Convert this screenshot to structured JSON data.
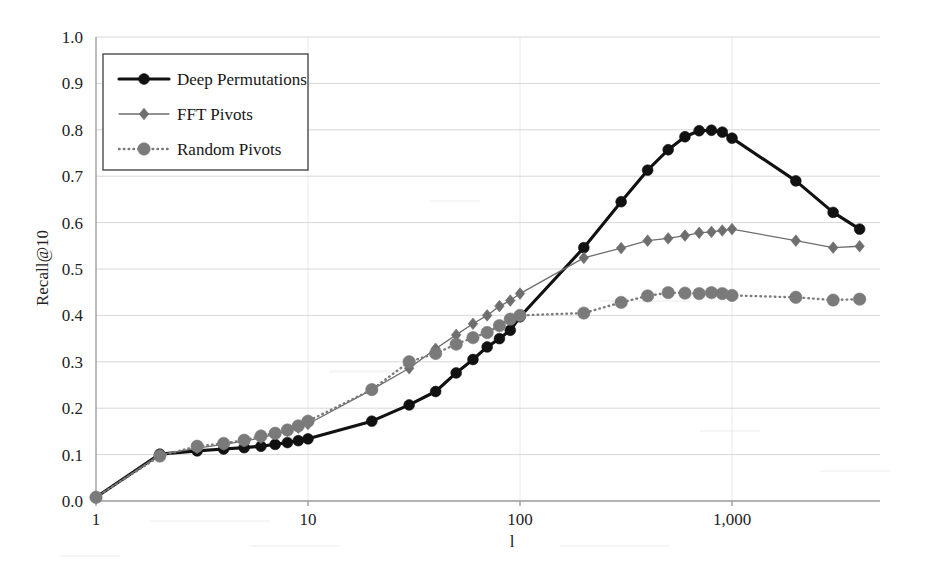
{
  "chart_data": {
    "type": "line",
    "title": "",
    "subtitle": "",
    "xlabel": "l",
    "ylabel": "Recall@10",
    "xscale": "log",
    "xlim": [
      1,
      4096
    ],
    "ylim": [
      0.0,
      1.0
    ],
    "grid": true,
    "legend_position": "top-left",
    "x_tick_labels": [
      "1",
      "10",
      "100",
      "1,000"
    ],
    "x_tick_values": [
      1,
      10,
      100,
      1000
    ],
    "y_tick_labels": [
      "0.0",
      "0.1",
      "0.2",
      "0.3",
      "0.4",
      "0.5",
      "0.6",
      "0.7",
      "0.8",
      "0.9",
      "1.0"
    ],
    "y_tick_values": [
      0.0,
      0.1,
      0.2,
      0.3,
      0.4,
      0.5,
      0.6,
      0.7,
      0.8,
      0.9,
      1.0
    ],
    "series": [
      {
        "name": "Deep Permutations",
        "marker": "circle",
        "color": "#111111",
        "line_style": "solid",
        "line_width": 3.1,
        "marker_size": 5.4,
        "x": [
          1,
          2,
          3,
          4,
          5,
          6,
          7,
          8,
          9,
          10,
          20,
          30,
          40,
          50,
          60,
          70,
          80,
          90,
          100,
          200,
          300,
          400,
          500,
          600,
          700,
          800,
          900,
          1000,
          2000,
          3000,
          4000
        ],
        "y": [
          0.008,
          0.101,
          0.108,
          0.112,
          0.115,
          0.118,
          0.122,
          0.126,
          0.13,
          0.134,
          0.172,
          0.207,
          0.236,
          0.276,
          0.305,
          0.332,
          0.35,
          0.368,
          0.397,
          0.546,
          0.645,
          0.713,
          0.757,
          0.785,
          0.798,
          0.799,
          0.795,
          0.782,
          0.69,
          0.622,
          0.586
        ]
      },
      {
        "name": "FFT Pivots",
        "marker": "diamond",
        "color": "#6e6e6e",
        "line_style": "solid",
        "line_width": 1.3,
        "marker_size": 5.2,
        "x": [
          1,
          2,
          3,
          4,
          5,
          6,
          7,
          8,
          9,
          10,
          20,
          30,
          40,
          50,
          60,
          70,
          80,
          90,
          100,
          200,
          300,
          400,
          500,
          600,
          700,
          800,
          900,
          1000,
          2000,
          3000,
          4000
        ],
        "y": [
          0.008,
          0.1,
          0.114,
          0.122,
          0.129,
          0.136,
          0.144,
          0.151,
          0.158,
          0.166,
          0.24,
          0.286,
          0.328,
          0.358,
          0.382,
          0.4,
          0.42,
          0.432,
          0.447,
          0.524,
          0.545,
          0.561,
          0.566,
          0.572,
          0.578,
          0.58,
          0.583,
          0.586,
          0.561,
          0.546,
          0.549
        ]
      },
      {
        "name": "Random Pivots",
        "marker": "circle",
        "color": "#7a7a7a",
        "line_style": "dotted",
        "line_width": 2.4,
        "marker_size": 6.2,
        "x": [
          1,
          2,
          3,
          4,
          5,
          6,
          7,
          8,
          9,
          10,
          20,
          30,
          40,
          50,
          60,
          70,
          80,
          90,
          100,
          200,
          300,
          400,
          500,
          600,
          700,
          800,
          900,
          1000,
          2000,
          3000,
          4000
        ],
        "y": [
          0.008,
          0.097,
          0.118,
          0.124,
          0.131,
          0.14,
          0.146,
          0.153,
          0.162,
          0.172,
          0.24,
          0.3,
          0.318,
          0.338,
          0.352,
          0.363,
          0.378,
          0.392,
          0.4,
          0.405,
          0.428,
          0.442,
          0.449,
          0.448,
          0.447,
          0.449,
          0.447,
          0.443,
          0.439,
          0.433,
          0.435
        ]
      }
    ]
  },
  "legend": {
    "items": [
      {
        "label": "Deep Permutations"
      },
      {
        "label": "FFT Pivots"
      },
      {
        "label": "Random Pivots"
      }
    ]
  },
  "axes": {
    "y_title": "Recall@10",
    "x_title": "l"
  }
}
